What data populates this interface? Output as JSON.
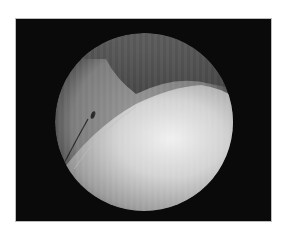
{
  "image": {
    "description": "Grayscale arthroscopic/endoscopic circular field of view showing a bright rounded tissue surface with a thin instrument on the left",
    "frame_color": "#0a0a0a",
    "background_color": "#ffffff",
    "view": {
      "shape": "circle",
      "cx": 128,
      "cy": 103,
      "r": 89
    },
    "colors": {
      "rim": "#6e6e6e",
      "dark_region": "#4a4a4a",
      "bright_tissue": "#e6e6e6",
      "instrument": "#2a2a2a"
    }
  }
}
